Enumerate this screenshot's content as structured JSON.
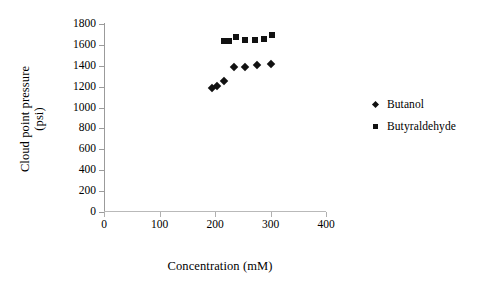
{
  "chart_data": {
    "type": "scatter",
    "title": "",
    "xlabel": "Concentration (mM)",
    "ylabel_line1": "Cloud point pressure",
    "ylabel_line2": "(psi)",
    "ylabel": "Cloud point pressure (psi)",
    "xlim": [
      0,
      400
    ],
    "ylim": [
      0,
      1800
    ],
    "xticks": [
      0,
      100,
      200,
      300,
      400
    ],
    "yticks": [
      0,
      200,
      400,
      600,
      800,
      1000,
      1200,
      1400,
      1600,
      1800
    ],
    "xtick_labels": [
      "0",
      "100",
      "200",
      "300",
      "400"
    ],
    "ytick_labels": [
      "0",
      "200",
      "400",
      "600",
      "800",
      "1000",
      "1200",
      "1400",
      "1600",
      "1800"
    ],
    "grid": false,
    "legend_position": "right",
    "series": [
      {
        "name": "Butanol",
        "marker": "diamond",
        "color": "#111111",
        "points": [
          {
            "x": 195,
            "y": 1190
          },
          {
            "x": 204,
            "y": 1205
          },
          {
            "x": 217,
            "y": 1250
          },
          {
            "x": 235,
            "y": 1385
          },
          {
            "x": 254,
            "y": 1385
          },
          {
            "x": 275,
            "y": 1405
          },
          {
            "x": 300,
            "y": 1420
          }
        ]
      },
      {
        "name": "Butyraldehyde",
        "marker": "square",
        "color": "#111111",
        "points": [
          {
            "x": 216,
            "y": 1635
          },
          {
            "x": 221,
            "y": 1635
          },
          {
            "x": 226,
            "y": 1640
          },
          {
            "x": 237,
            "y": 1675
          },
          {
            "x": 254,
            "y": 1650
          },
          {
            "x": 272,
            "y": 1650
          },
          {
            "x": 288,
            "y": 1658
          },
          {
            "x": 302,
            "y": 1690
          }
        ]
      }
    ]
  },
  "legend": {
    "items": [
      {
        "label": "Butanol",
        "marker": "diamond"
      },
      {
        "label": "Butyraldehyde",
        "marker": "square"
      }
    ]
  }
}
